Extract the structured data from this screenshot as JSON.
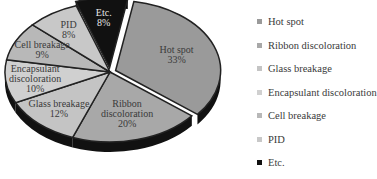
{
  "chart_data": {
    "type": "pie",
    "title": "",
    "style": "3D exploded pie",
    "legend_position": "right",
    "categories": [
      "Hot spot",
      "Ribbon discoloration",
      "Glass breakage",
      "Encapsulant discoloration",
      "Cell breakage",
      "PID",
      "Etc."
    ],
    "values": [
      33,
      20,
      12,
      10,
      9,
      8,
      8
    ],
    "unit": "%",
    "labels": [
      "Hot spot\n33%",
      "Ribbon\ndiscoloration\n20%",
      "Glass breakage\n12%",
      "Encapsulant\ndiscoloration\n10%",
      "Cell breakage\n9%",
      "PID\n8%",
      "Etc.\n8%"
    ],
    "colors": [
      "#9a9a9a",
      "#a8a8a8",
      "#c4c4c4",
      "#d0d0d0",
      "#b8b8b8",
      "#c8c8c8",
      "#111111"
    ]
  },
  "legend": {
    "items": [
      {
        "label": "Hot spot",
        "color": "#9a9a9a"
      },
      {
        "label": "Ribbon discoloration",
        "color": "#a8a8a8"
      },
      {
        "label": "Glass breakage",
        "color": "#c4c4c4"
      },
      {
        "label": "Encapsulant discoloration",
        "color": "#d0d0d0"
      },
      {
        "label": "Cell breakage",
        "color": "#b8b8b8"
      },
      {
        "label": "PID",
        "color": "#c8c8c8"
      },
      {
        "label": "Etc.",
        "color": "#111111"
      }
    ]
  }
}
